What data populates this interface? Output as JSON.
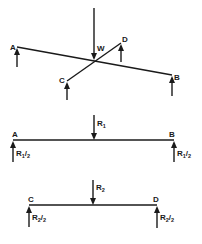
{
  "diagram": {
    "top_view": {
      "load_label": "W",
      "points": {
        "A": "A",
        "B": "B",
        "C": "C",
        "D": "D"
      }
    },
    "beam_ab": {
      "load": {
        "main": "R",
        "sub": "1"
      },
      "end_a": "A",
      "end_b": "B",
      "reaction_left": {
        "main": "R",
        "sub": "1",
        "slash": "/",
        "den": "2"
      },
      "reaction_right": {
        "main": "R",
        "sub": "1",
        "slash": "/",
        "den": "2"
      }
    },
    "beam_cd": {
      "load": {
        "main": "R",
        "sub": "2"
      },
      "end_c": "C",
      "end_d": "D",
      "reaction_left": {
        "main": "R",
        "sub": "2",
        "slash": "/",
        "den": "2"
      },
      "reaction_right": {
        "main": "R",
        "sub": "2",
        "slash": "/",
        "den": "2"
      }
    },
    "colors": {
      "ink": "#1a1a1a",
      "background": "#ffffff"
    }
  }
}
